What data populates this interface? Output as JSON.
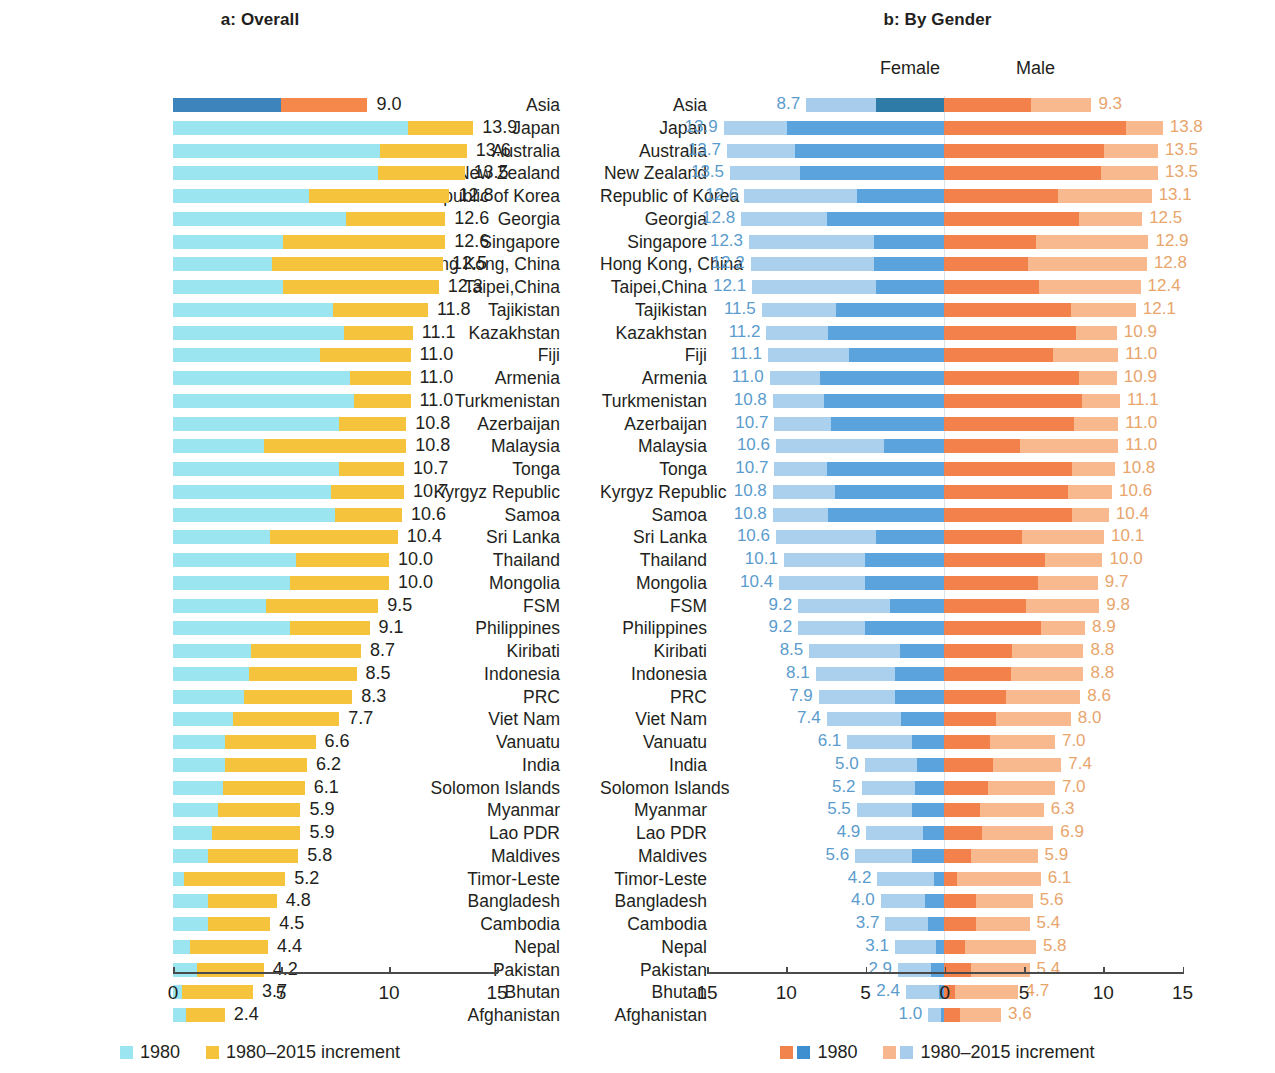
{
  "panel_a": {
    "title": "a: Overall",
    "legend": [
      {
        "label": "1980",
        "color": "#9be5f0"
      },
      {
        "label": "1980–2015 increment",
        "color": "#f5c43c"
      }
    ],
    "axis": {
      "ticks": [
        "0",
        "5",
        "10",
        "15"
      ]
    }
  },
  "panel_b": {
    "title": "b: By Gender",
    "female_header": "Female",
    "male_header": "Male",
    "legend": [
      {
        "label": "1980",
        "colors": [
          "#f0844c",
          "#3e8fd0"
        ]
      },
      {
        "label": "1980–2015 increment",
        "colors": [
          "#f7b68e",
          "#a8cdec"
        ]
      }
    ],
    "axis": {
      "ticks": [
        "15",
        "10",
        "5",
        "0",
        "5",
        "10",
        "15"
      ]
    }
  },
  "colors": {
    "a_1980": "#9be5f0",
    "a_increment": "#f5c43c",
    "a_asia_1980": "#3d84bd",
    "a_asia_increment": "#f5884a",
    "female_1980": "#5ba3dc",
    "female_increment": "#abd0ee",
    "female_asia_1980": "#2f7ba8",
    "female_asia_increment": "#a8cdec",
    "male_1980": "#f2814b",
    "male_increment": "#f8b98f",
    "male_asia_1980": "#f2814b",
    "male_asia_increment": "#f8b98f",
    "female_value_text": "#5b9ccd",
    "male_value_text": "#e8a56c"
  },
  "chart_data": [
    {
      "type": "bar",
      "id": "overall",
      "title": "a: Overall",
      "orientation": "horizontal",
      "stacked": true,
      "xlabel": "",
      "ylabel": "",
      "xlim": [
        0,
        15
      ],
      "xticks": [
        0,
        5,
        10,
        15
      ],
      "grid": false,
      "legend_position": "bottom",
      "series": [
        {
          "name": "1980",
          "color": "#9be5f0"
        },
        {
          "name": "1980–2015 increment",
          "color": "#f5c43c"
        }
      ],
      "categories": [
        "Asia",
        "Japan",
        "Australia",
        "New Zealand",
        "Republic of Korea",
        "Georgia",
        "Singapore",
        "Hong Kong, China",
        "Taipei,China",
        "Tajikistan",
        "Kazakhstan",
        "Fiji",
        "Armenia",
        "Turkmenistan",
        "Azerbaijan",
        "Malaysia",
        "Tonga",
        "Kyrgyz Republic",
        "Samoa",
        "Sri Lanka",
        "Thailand",
        "Mongolia",
        "FSM",
        "Philippines",
        "Kiribati",
        "Indonesia",
        "PRC",
        "Viet Nam",
        "Vanuatu",
        "India",
        "Solomon Islands",
        "Myanmar",
        "Lao PDR",
        "Maldives",
        "Timor-Leste",
        "Bangladesh",
        "Cambodia",
        "Nepal",
        "Pakistan",
        "Bhutan",
        "Afghanistan"
      ],
      "totals": [
        9.0,
        13.9,
        13.6,
        13.5,
        12.8,
        12.6,
        12.6,
        12.5,
        12.3,
        11.8,
        11.1,
        11.0,
        11.0,
        11.0,
        10.8,
        10.8,
        10.7,
        10.7,
        10.6,
        10.4,
        10.0,
        10.0,
        9.5,
        9.1,
        8.7,
        8.5,
        8.3,
        7.7,
        6.6,
        6.2,
        6.1,
        5.9,
        5.9,
        5.8,
        5.2,
        4.8,
        4.5,
        4.4,
        4.2,
        3.7,
        2.4
      ],
      "values_1980": [
        5.0,
        10.9,
        9.6,
        9.5,
        6.3,
        8.0,
        5.1,
        4.6,
        5.1,
        7.4,
        7.9,
        6.8,
        8.2,
        8.4,
        7.7,
        4.2,
        7.7,
        7.3,
        7.5,
        4.5,
        5.7,
        5.4,
        4.3,
        5.4,
        3.6,
        3.5,
        3.3,
        2.8,
        2.4,
        2.4,
        2.3,
        2.1,
        1.8,
        1.6,
        0.5,
        1.6,
        1.6,
        0.8,
        1.1,
        0.4,
        0.6
      ],
      "values_increment": [
        4.0,
        3.0,
        4.0,
        4.0,
        6.5,
        4.6,
        7.5,
        7.9,
        7.2,
        4.4,
        3.2,
        4.2,
        2.8,
        2.6,
        3.1,
        6.6,
        3.0,
        3.4,
        3.1,
        5.9,
        4.3,
        4.6,
        5.2,
        3.7,
        5.1,
        5.0,
        5.0,
        4.9,
        4.2,
        3.8,
        3.8,
        3.8,
        4.1,
        4.2,
        4.7,
        3.2,
        2.9,
        3.6,
        3.1,
        3.3,
        1.8
      ],
      "labels": [
        "9.0",
        "13.9",
        "13.6",
        "13.5",
        "12.8",
        "12.6",
        "12.6",
        "12.5",
        "12.3",
        "11.8",
        "11.1",
        "11.0",
        "11.0",
        "11.0",
        "10.8",
        "10.8",
        "10.7",
        "10.7",
        "10.6",
        "10.4",
        "10.0",
        "10.0",
        "9.5",
        "9.1",
        "8.7",
        "8.5",
        "8.3",
        "7.7",
        "6.6",
        "6.2",
        "6.1",
        "5.9",
        "5.9",
        "5.8",
        "5.2",
        "4.8",
        "4.5",
        "4.4",
        "4.2",
        "3.7",
        "2.4"
      ]
    },
    {
      "type": "bar",
      "id": "by_gender",
      "title": "b: By Gender",
      "orientation": "horizontal",
      "stacked": true,
      "diverging": true,
      "xlabel": "",
      "ylabel": "",
      "xlim": [
        -15,
        15
      ],
      "xticks": [
        -15,
        -10,
        -5,
        0,
        5,
        10,
        15
      ],
      "xtick_labels": [
        "15",
        "10",
        "5",
        "0",
        "5",
        "10",
        "15"
      ],
      "grid": false,
      "legend_position": "bottom",
      "series": [
        {
          "name": "Female 1980",
          "color": "#5ba3dc"
        },
        {
          "name": "Female 1980–2015 increment",
          "color": "#abd0ee"
        },
        {
          "name": "Male 1980",
          "color": "#f2814b"
        },
        {
          "name": "Male 1980–2015 increment",
          "color": "#f8b98f"
        }
      ],
      "categories": [
        "Asia",
        "Japan",
        "Australia",
        "New Zealand",
        "Republic of Korea",
        "Georgia",
        "Singapore",
        "Hong Kong, China",
        "Taipei,China",
        "Tajikistan",
        "Kazakhstan",
        "Fiji",
        "Armenia",
        "Turkmenistan",
        "Azerbaijan",
        "Malaysia",
        "Tonga",
        "Kyrgyz Republic",
        "Samoa",
        "Sri Lanka",
        "Thailand",
        "Mongolia",
        "FSM",
        "Philippines",
        "Kiribati",
        "Indonesia",
        "PRC",
        "Viet Nam",
        "Vanuatu",
        "India",
        "Solomon Islands",
        "Myanmar",
        "Lao PDR",
        "Maldives",
        "Timor-Leste",
        "Bangladesh",
        "Cambodia",
        "Nepal",
        "Pakistan",
        "Bhutan",
        "Afghanistan"
      ],
      "female_totals": [
        8.7,
        13.9,
        13.7,
        13.5,
        12.6,
        12.8,
        12.3,
        12.2,
        12.1,
        11.5,
        11.2,
        11.1,
        11.0,
        10.8,
        10.7,
        10.6,
        10.7,
        10.8,
        10.8,
        10.6,
        10.1,
        10.4,
        9.2,
        9.2,
        8.5,
        8.1,
        7.9,
        7.4,
        6.1,
        5.0,
        5.2,
        5.5,
        4.9,
        5.6,
        4.2,
        4.0,
        3.7,
        3.1,
        2.9,
        2.4,
        1.0
      ],
      "female_1980": [
        4.3,
        9.9,
        9.4,
        9.1,
        5.5,
        7.4,
        4.4,
        4.4,
        4.3,
        6.8,
        7.3,
        6.0,
        7.8,
        7.6,
        7.1,
        3.8,
        7.4,
        6.9,
        7.3,
        4.3,
        5.0,
        5.0,
        3.4,
        5.0,
        2.8,
        3.1,
        3.1,
        2.7,
        2.0,
        1.7,
        1.8,
        2.0,
        1.3,
        2.0,
        0.6,
        1.2,
        1.0,
        0.5,
        0.8,
        0.3,
        0.2
      ],
      "female_increment": [
        4.4,
        4.0,
        4.3,
        4.4,
        7.1,
        5.4,
        7.9,
        7.8,
        7.8,
        4.7,
        3.9,
        5.1,
        3.2,
        3.2,
        3.6,
        6.8,
        3.3,
        3.9,
        3.5,
        6.3,
        5.1,
        5.4,
        5.8,
        4.2,
        5.7,
        5.0,
        4.8,
        4.7,
        4.1,
        3.3,
        3.4,
        3.5,
        3.6,
        3.6,
        3.6,
        2.8,
        2.7,
        2.6,
        2.1,
        2.1,
        0.8
      ],
      "female_labels": [
        "8.7",
        "13.9",
        "13.7",
        "13.5",
        "12.6",
        "12.8",
        "12.3",
        "12.2",
        "12.1",
        "11.5",
        "11.2",
        "11.1",
        "11.0",
        "10.8",
        "10.7",
        "10.6",
        "10.7",
        "10.8",
        "10.8",
        "10.6",
        "10.1",
        "10.4",
        "9.2",
        "9.2",
        "8.5",
        "8.1",
        "7.9",
        "7.4",
        "6.1",
        "5.0",
        "5.2",
        "5.5",
        "4.9",
        "5.6",
        "4.2",
        "4.0",
        "3.7",
        "3.1",
        "2.9",
        "2.4",
        "1.0"
      ],
      "male_totals": [
        9.3,
        13.8,
        13.5,
        13.5,
        13.1,
        12.5,
        12.9,
        12.8,
        12.4,
        12.1,
        10.9,
        11.0,
        10.9,
        11.1,
        11.0,
        11.0,
        10.8,
        10.6,
        10.4,
        10.1,
        10.0,
        9.7,
        9.8,
        8.9,
        8.8,
        8.8,
        8.6,
        8.0,
        7.0,
        7.4,
        7.0,
        6.3,
        6.9,
        5.9,
        6.1,
        5.6,
        5.4,
        5.8,
        5.4,
        4.7,
        3.6
      ],
      "male_1980": [
        5.5,
        11.5,
        10.1,
        9.9,
        7.2,
        8.5,
        5.8,
        5.3,
        6.0,
        8.0,
        8.3,
        6.9,
        8.5,
        8.7,
        8.2,
        4.8,
        8.1,
        7.8,
        8.1,
        4.9,
        6.4,
        5.9,
        5.2,
        6.1,
        4.3,
        4.2,
        3.9,
        3.3,
        2.9,
        3.1,
        2.8,
        2.3,
        2.4,
        1.7,
        0.8,
        2.0,
        2.0,
        1.3,
        1.7,
        0.7,
        1.0
      ],
      "male_increment": [
        3.8,
        2.3,
        3.4,
        3.6,
        5.9,
        4.0,
        7.1,
        7.5,
        6.4,
        4.1,
        2.6,
        4.1,
        2.4,
        2.4,
        2.8,
        6.2,
        2.7,
        2.8,
        2.3,
        5.2,
        3.6,
        3.8,
        4.6,
        2.8,
        4.5,
        4.6,
        4.7,
        4.7,
        4.1,
        4.3,
        4.2,
        4.0,
        4.5,
        4.2,
        5.3,
        3.6,
        3.4,
        4.5,
        3.7,
        4.0,
        2.6
      ],
      "male_labels": [
        "9.3",
        "13.8",
        "13.5",
        "13.5",
        "13.1",
        "12.5",
        "12.9",
        "12.8",
        "12.4",
        "12.1",
        "10.9",
        "11.0",
        "10.9",
        "11.1",
        "11.0",
        "11.0",
        "10.8",
        "10.6",
        "10.4",
        "10.1",
        "10.0",
        "9.7",
        "9.8",
        "8.9",
        "8.8",
        "8.8",
        "8.6",
        "8.0",
        "7.0",
        "7.4",
        "7.0",
        "6.3",
        "6.9",
        "5.9",
        "6.1",
        "5.6",
        "5.4",
        "5.8",
        "5.4",
        "4.7",
        "3,6"
      ]
    }
  ]
}
